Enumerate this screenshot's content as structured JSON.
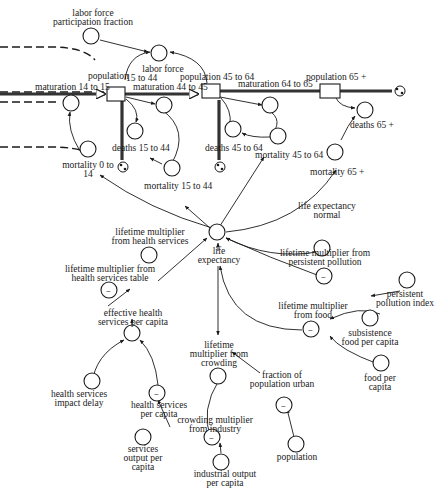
{
  "diagram": {
    "type": "stock-and-flow",
    "colors": {
      "ink": "#1a1a1a",
      "background": "#ffffff"
    },
    "stocks": {
      "pop15to44": "population 15 to 44",
      "pop15to44_a": "population",
      "pop15to44_b": "15 to 44",
      "pop45to64": "population 45 to 64",
      "pop65": "population 65 +"
    },
    "flows": {
      "mat14to15": "maturation 14 to 15",
      "mat44to45": "maturation 44 to 45",
      "mat64to65": "maturation 64 to 65",
      "deaths15to44": "deaths 15 to 44",
      "deaths45to64": "deaths 45 to 64",
      "deaths65": "deaths 65 +"
    },
    "auxiliaries": {
      "lfpf_1": "labor force",
      "lfpf_2": "participation fraction",
      "labor_force": "labor force",
      "mort0to14_1": "mortality 0 to",
      "mort0to14_2": "14",
      "mort15to44": "mortality 15 to 44",
      "mort45to64": "mortality 45 to 64",
      "mort65": "mortality 65 +",
      "le_normal_1": "life expectancy",
      "le_normal_2": "normal",
      "le_1": "life",
      "le_2": "expectancy",
      "lmhs_1": "lifetime multiplier",
      "lmhs_2": "from health services",
      "lmhst_1": "lifetime multiplier from",
      "lmhst_2": "health services table",
      "ehspc_1": "effective health",
      "ehspc_2": "services per capita",
      "hsid_1": "health services",
      "hsid_2": "impact delay",
      "hspc_1": "health services",
      "hspc_2": "per capita",
      "sopc_1": "services",
      "sopc_2": "output per",
      "sopc_3": "capita",
      "lmpp_1": "lifetime multiplier from",
      "lmpp_2": "persistent pollution",
      "ppi_1": "persistent",
      "ppi_2": "pollution index",
      "lmf_1": "lifetime multiplier",
      "lmf_2": "from food",
      "sfpc_1": "subsistence",
      "sfpc_2": "food per capita",
      "fpc_1": "food per",
      "fpc_2": "capita",
      "lmc_1": "lifetime",
      "lmc_2": "multiplier from",
      "lmc_3": "crowding",
      "cmi_1": "crowding multiplier",
      "cmi_2": "from industry",
      "iopc_1": "industrial output",
      "iopc_2": "per capita",
      "fpu_1": "fraction of",
      "fpu_2": "population urban",
      "population": "population"
    },
    "table_marker": "~"
  }
}
